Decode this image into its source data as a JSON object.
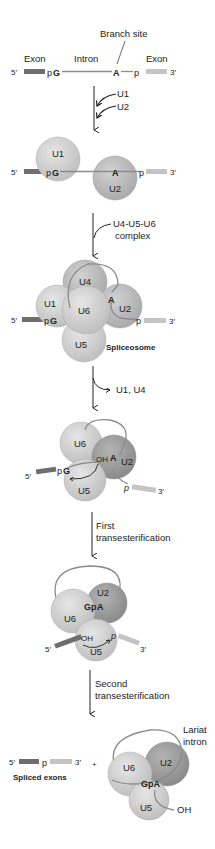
{
  "colors": {
    "exon5": "#6e6e6e",
    "exon3": "#c4c4c4",
    "intron": "#8c8c8c",
    "snrnp_light": "#d4d4d4",
    "snrnp_mid": "#c6c6c6",
    "snrnp_dark": "#9e9e9e",
    "arrow": "#222222"
  },
  "step1": {
    "branch_site": "Branch site",
    "exon_left": "Exon",
    "intron": "Intron",
    "exon_right": "Exon",
    "five_prime": "5′",
    "pG": "pG",
    "p_pre": "p",
    "G": "G",
    "A": "A",
    "p": "p",
    "three_prime": "3′"
  },
  "arrow1": {
    "inputs": [
      "U1",
      "U2"
    ]
  },
  "step2": {
    "five_prime": "5′",
    "p": "p",
    "G": "G",
    "A": "A",
    "p3": "p",
    "three_prime": "3′",
    "u1": "U1",
    "u2": "U2"
  },
  "arrow2": {
    "label_line1": "U4-U5-U6",
    "label_line2": "complex"
  },
  "step3": {
    "u1": "U1",
    "u2": "U2",
    "u4": "U4",
    "u5": "U5",
    "u6": "U6",
    "A": "A",
    "p": "p",
    "G": "G",
    "p3": "p",
    "five_prime": "5′",
    "three_prime": "3′",
    "caption": "Spliceosome"
  },
  "arrow3": {
    "release": "U1, U4"
  },
  "step4": {
    "u6": "U6",
    "u2": "U2",
    "u5": "U5",
    "oh": "OH",
    "A": "A",
    "p": "p",
    "G": "G",
    "p3": "p",
    "five_prime": "5′",
    "three_prime": "3′"
  },
  "arrow4": {
    "label_line1": "First",
    "label_line2": "transesterification"
  },
  "step5": {
    "u2": "U2",
    "u6": "U6",
    "u5": "U5",
    "gp": "Gp",
    "A": "A",
    "oh": "OH",
    "p": "p",
    "five_prime": "5′",
    "three_prime": "3′"
  },
  "arrow5": {
    "label_line1": "Second",
    "label_line2": "transesterification"
  },
  "step6": {
    "five_prime": "5′",
    "p": "p",
    "three_prime": "3′",
    "plus": "+",
    "spliced_caption": "Spliced exons",
    "lariat_line1": "Lariat",
    "lariat_line2": "intron",
    "u6": "U6",
    "u2": "U2",
    "u5": "U5",
    "gpa": "GpA",
    "oh": "OH"
  }
}
